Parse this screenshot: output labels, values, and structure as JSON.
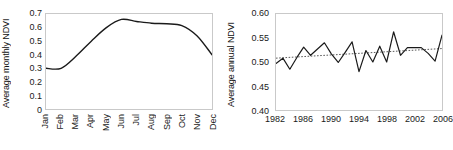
{
  "figure": {
    "background": "#ffffff",
    "line_color": "#1a1a1a",
    "trend_color": "#555555",
    "frame_color": "#c9c9c9"
  },
  "chart_data": [
    {
      "type": "line",
      "id": "monthly-ndvi",
      "title": "",
      "xlabel": "",
      "ylabel": "Average monthly NDVI",
      "categories": [
        "Jan",
        "Feb",
        "Mar",
        "Apr",
        "May",
        "Jun",
        "Jul",
        "Aug",
        "Sep",
        "Oct",
        "Nov",
        "Dec"
      ],
      "values": [
        0.3,
        0.3,
        0.39,
        0.5,
        0.6,
        0.66,
        0.645,
        0.632,
        0.628,
        0.615,
        0.54,
        0.4
      ],
      "ylim": [
        0,
        0.7
      ],
      "yticks": [
        "0.7",
        "0.6",
        "0.5",
        "0.4",
        "0.3",
        "0.2",
        "0.1",
        "0"
      ],
      "ytick_values": [
        0.7,
        0.6,
        0.5,
        0.4,
        0.3,
        0.2,
        0.1,
        0
      ],
      "grid": false,
      "legend": false,
      "xtick_rotation": 90,
      "smooth": true
    },
    {
      "type": "line",
      "id": "annual-ndvi",
      "title": "",
      "xlabel": "",
      "ylabel": "Average annual NDVI",
      "x": [
        1982,
        1983,
        1984,
        1985,
        1986,
        1987,
        1988,
        1989,
        1990,
        1991,
        1992,
        1993,
        1994,
        1995,
        1996,
        1997,
        1998,
        1999,
        2000,
        2001,
        2002,
        2003,
        2004,
        2005,
        2006
      ],
      "values": [
        0.497,
        0.508,
        0.485,
        0.509,
        0.531,
        0.514,
        0.527,
        0.54,
        0.517,
        0.499,
        0.52,
        0.542,
        0.48,
        0.524,
        0.5,
        0.533,
        0.5,
        0.563,
        0.514,
        0.53,
        0.53,
        0.53,
        0.518,
        0.502,
        0.556
      ],
      "ylim": [
        0.4,
        0.6
      ],
      "yticks": [
        "0.60",
        "0.55",
        "0.50",
        "0.45",
        "0.40"
      ],
      "ytick_values": [
        0.6,
        0.55,
        0.5,
        0.45,
        0.4
      ],
      "xticks": [
        "1982",
        "1986",
        "1990",
        "1994",
        "1998",
        "2002",
        "2006"
      ],
      "xtick_values": [
        1982,
        1986,
        1990,
        1994,
        1998,
        2002,
        2006
      ],
      "xlim": [
        1982,
        2006
      ],
      "grid": false,
      "legend": false,
      "xtick_rotation": 0,
      "trendline": {
        "style": "dotted",
        "start_value": 0.508,
        "end_value": 0.528
      }
    }
  ]
}
